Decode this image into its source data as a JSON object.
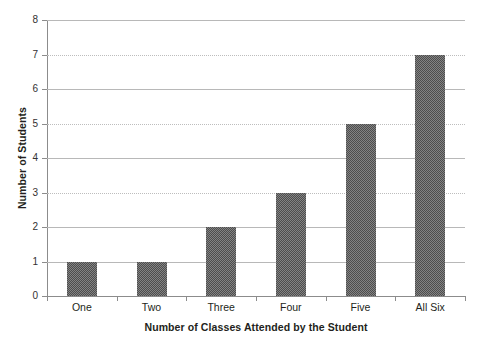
{
  "chart_data": {
    "type": "bar",
    "title": "",
    "xlabel": "Number of Classes Attended by the Student",
    "ylabel": "Number of Students",
    "categories": [
      "One",
      "Two",
      "Three",
      "Four",
      "Five",
      "All Six"
    ],
    "values": [
      1,
      1,
      2,
      3,
      5,
      7
    ],
    "ylim": [
      0,
      8
    ],
    "y_ticks": [
      0,
      1,
      2,
      3,
      4,
      5,
      6,
      7,
      8
    ],
    "y_tick_labels": [
      "0",
      "1",
      "2",
      "3",
      "4",
      "5",
      "6",
      "7",
      "8"
    ],
    "grid": true,
    "grid_axis": "y",
    "legend": null,
    "bar_color": "#4d4d4d",
    "bar_pattern": "dithered-checker",
    "gridline_color": "#b8b8b8",
    "axis_color": "#8c8c8c",
    "background": "#ffffff"
  },
  "axes": {
    "y_title": "Number of Students",
    "x_title": "Number of Classes Attended by the Student"
  }
}
